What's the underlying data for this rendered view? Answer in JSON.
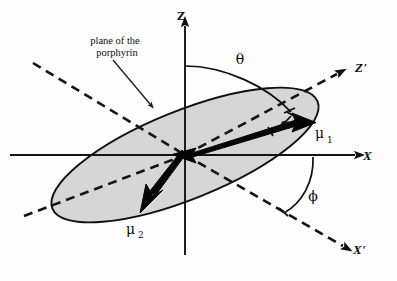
{
  "figure": {
    "background_color": "#fdfdfd",
    "plane_fill_color": "#d2d2d2",
    "ink_color": "#101010"
  },
  "axes": {
    "lab_frame": [
      {
        "id": "z-axis",
        "label": "Z",
        "style": "solid",
        "direction": "up",
        "arrow": true
      },
      {
        "id": "x-axis",
        "label": "X",
        "style": "solid",
        "direction": "right",
        "arrow": true
      }
    ],
    "molecular_frame": [
      {
        "id": "z-prime-axis",
        "label": "Z'",
        "style": "dashed",
        "direction": "upper-right",
        "arrow": true
      },
      {
        "id": "x-prime-axis",
        "label": "X'",
        "style": "dashed",
        "direction": "lower-right",
        "arrow": true
      }
    ]
  },
  "plane": {
    "caption_line_1": "plane of the",
    "caption_line_2": "porphyrin",
    "caption_full": "plane of the porphyrin",
    "shape": "ellipse",
    "fill": "#d2d2d2"
  },
  "angles": [
    {
      "id": "theta",
      "symbol": "θ",
      "between": "Z axis and Z' axis"
    },
    {
      "id": "alpha",
      "symbol": "α",
      "between": "Z' axis and μ1 transition dipole"
    },
    {
      "id": "phi",
      "symbol": "ϕ",
      "between": "X axis and X' axis"
    }
  ],
  "vectors": [
    {
      "id": "mu-1",
      "symbol": "μ",
      "subscript": "1",
      "direction": "upper-right",
      "style": "bold-solid-arrow"
    },
    {
      "id": "mu-2",
      "symbol": "μ",
      "subscript": "2",
      "direction": "lower-left",
      "style": "bold-solid-arrow"
    }
  ]
}
